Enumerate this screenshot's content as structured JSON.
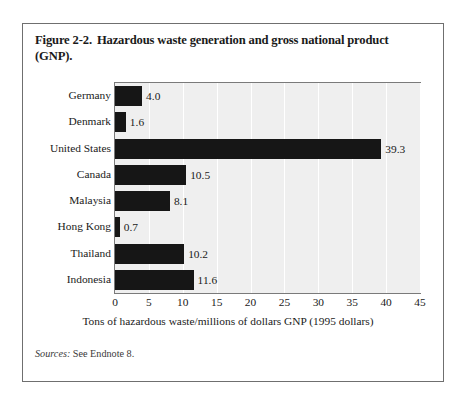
{
  "figure": {
    "number": "Figure 2-2.",
    "title_line1": "Hazardous waste generation and gross national product",
    "title_line2": "(GNP)."
  },
  "sources": {
    "label": "Sources:",
    "text": "See Endnote 8."
  },
  "chart_data": {
    "type": "bar",
    "orientation": "horizontal",
    "categories": [
      "Germany",
      "Denmark",
      "United States",
      "Canada",
      "Malaysia",
      "Hong Kong",
      "Thailand",
      "Indonesia"
    ],
    "values": [
      4.0,
      1.6,
      39.3,
      10.5,
      8.1,
      0.7,
      10.2,
      11.6
    ],
    "value_labels": [
      "4.0",
      "1.6",
      "39.3",
      "10.5",
      "8.1",
      "0.7",
      "10.2",
      "11.6"
    ],
    "xlabel": "Tons of hazardous waste/millions of dollars GNP (1995 dollars)",
    "ylabel": "",
    "xlim": [
      0,
      45
    ],
    "xticks": [
      0,
      5,
      10,
      15,
      20,
      25,
      30,
      35,
      40,
      45
    ],
    "xtick_labels": [
      "0",
      "5",
      "10",
      "15",
      "20",
      "25",
      "30",
      "35",
      "40",
      "45"
    ],
    "grid": true,
    "grid_axis": "x",
    "legend": false,
    "bar_color": "#161616",
    "plot_background": "#efefef",
    "gridline_color": "#ffffff"
  }
}
